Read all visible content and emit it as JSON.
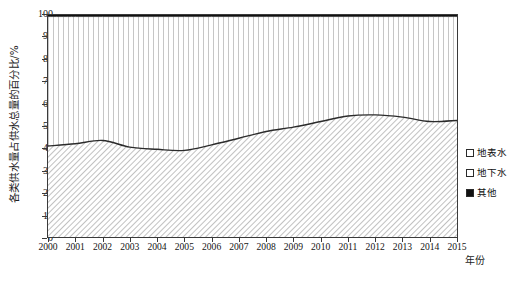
{
  "chart_data": {
    "type": "area",
    "stacked": true,
    "title": "",
    "xlabel": "年份",
    "ylabel": "各类供水量占供水总量的百分比/%",
    "ylim": [
      0,
      100
    ],
    "yticks": [
      0,
      10,
      20,
      30,
      40,
      50,
      60,
      70,
      80,
      90,
      100
    ],
    "grid": false,
    "legend_position": "right",
    "categories": [
      "2000",
      "2001",
      "2002",
      "2003",
      "2004",
      "2005",
      "2006",
      "2007",
      "2008",
      "2009",
      "2010",
      "2011",
      "2012",
      "2013",
      "2014",
      "2015"
    ],
    "series": [
      {
        "name": "地表水",
        "fill": "diagonal-hatch",
        "values": [
          41.0,
          42.0,
          43.5,
          40.5,
          39.5,
          39.0,
          41.5,
          44.5,
          47.5,
          49.5,
          52.0,
          54.5,
          55.0,
          54.0,
          52.0,
          52.5
        ]
      },
      {
        "name": "地下水",
        "fill": "vertical-hatch",
        "values": [
          58.3,
          57.3,
          55.8,
          58.8,
          59.8,
          60.3,
          57.8,
          54.8,
          51.8,
          49.8,
          47.3,
          44.8,
          44.3,
          45.3,
          47.3,
          46.8
        ]
      },
      {
        "name": "其他",
        "fill": "solid-black",
        "values": [
          0.7,
          0.7,
          0.7,
          0.7,
          0.7,
          0.7,
          0.7,
          0.7,
          0.7,
          0.7,
          0.7,
          0.7,
          0.7,
          0.7,
          0.7,
          0.7
        ]
      }
    ],
    "cumulative_upper_surface": [
      41.0,
      42.0,
      43.5,
      40.5,
      39.5,
      39.0,
      41.5,
      44.5,
      47.5,
      49.5,
      52.0,
      54.5,
      55.0,
      54.0,
      52.0,
      52.5
    ],
    "cumulative_upper_ground": [
      99.3,
      99.3,
      99.3,
      99.3,
      99.3,
      99.3,
      99.3,
      99.3,
      99.3,
      99.3,
      99.3,
      99.3,
      99.3,
      99.3,
      99.3,
      99.3
    ]
  },
  "axis": {
    "y_title": "各类供水量占供水总量的百分比/%",
    "x_title": "年份",
    "y_ticks": [
      "100",
      "90",
      "80",
      "70",
      "60",
      "50",
      "40",
      "30",
      "20",
      "10",
      "0"
    ],
    "x_ticks": [
      "2000",
      "2001",
      "2002",
      "2003",
      "2004",
      "2005",
      "2006",
      "2007",
      "2008",
      "2009",
      "2010",
      "2011",
      "2012",
      "2013",
      "2014",
      "2015"
    ]
  },
  "legend": {
    "items": [
      {
        "label": "地表水",
        "marker": "outlined-square-diagonal"
      },
      {
        "label": "地下水",
        "marker": "outlined-square-vertical"
      },
      {
        "label": "其他",
        "marker": "filled-square-black"
      }
    ]
  },
  "caption": {
    "text": ""
  },
  "colors": {
    "axis": "#3a3a3a",
    "line": "#2b2b2b",
    "hatch": "#8a8a8a",
    "other_band": "#111111",
    "background": "#ffffff",
    "text": "#151515"
  }
}
